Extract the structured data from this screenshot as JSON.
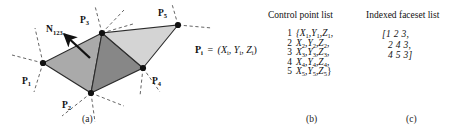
{
  "figure": {
    "panel_a": {
      "caption": "(a)",
      "normal_label": "N",
      "normal_label_sub": "123",
      "point_equation": {
        "lhs": "P",
        "lhs_sub": "i",
        "eq": "=",
        "rhs": "(X",
        "rhs_sub1": "i",
        "rhs_mid1": ", Y",
        "rhs_sub2": "i",
        "rhs_mid2": ", Z",
        "rhs_sub3": "i",
        "rhs_end": ")"
      },
      "vertices": [
        {
          "name": "P",
          "sub": "1",
          "x": 43,
          "y": 63,
          "lx": 26,
          "ly": 80
        },
        {
          "name": "P",
          "sub": "2",
          "x": 91,
          "y": 93,
          "lx": 66,
          "ly": 104
        },
        {
          "name": "P",
          "sub": "3",
          "x": 102,
          "y": 33,
          "lx": 82,
          "ly": 20
        },
        {
          "name": "P",
          "sub": "4",
          "x": 143,
          "y": 68,
          "lx": 152,
          "ly": 80
        },
        {
          "name": "P",
          "sub": "5",
          "x": 178,
          "y": 25,
          "lx": 160,
          "ly": 14
        }
      ],
      "faces": [
        {
          "indices": "1 2 3",
          "fill": "#aaaaaa"
        },
        {
          "indices": "2 4 3",
          "fill": "#878787"
        },
        {
          "indices": "4 5 3",
          "fill": "#d4d4d4"
        }
      ]
    },
    "panel_b": {
      "caption": "(b)",
      "heading": "Control point list",
      "rows": [
        {
          "index": "1",
          "text": "{X",
          "s1": "1",
          "t2": ",Y",
          "s2": "1",
          "t3": ",Z",
          "s3": "1",
          "t4": ","
        },
        {
          "index": "2",
          "text": "X",
          "s1": "2",
          "t2": ",Y",
          "s2": "2",
          "t3": ",Z",
          "s3": "2",
          "t4": ","
        },
        {
          "index": "3",
          "text": "X",
          "s1": "3",
          "t2": ",Y",
          "s2": "3",
          "t3": ",Z",
          "s3": "3",
          "t4": ","
        },
        {
          "index": "4",
          "text": "X",
          "s1": "4",
          "t2": ",Y",
          "s2": "4",
          "t3": ",Z",
          "s3": "4",
          "t4": ","
        },
        {
          "index": "5",
          "text": "X",
          "s1": "5",
          "t2": ",Y",
          "s2": "5",
          "t3": ",Z",
          "s3": "5",
          "t4": "}"
        }
      ]
    },
    "panel_c": {
      "caption": "(c)",
      "heading": "Indexed faceset list",
      "rows": [
        "[1  2  3,",
        "2  4  3,",
        "4  5  3]"
      ]
    }
  },
  "colors": {
    "face_light": "#d4d4d4",
    "face_medium": "#aaaaaa",
    "face_dark": "#878787",
    "stroke": "#2b2b2b",
    "dash": "#555555",
    "background": "#ffffff"
  }
}
